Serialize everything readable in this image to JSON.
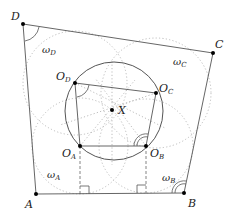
{
  "diagram": {
    "title": "",
    "colors": {
      "line": "#555555",
      "dotted": "#b5b5b5",
      "point": "#000000",
      "label": "#222222",
      "background": "#ffffff"
    },
    "vertices": [
      {
        "id": "A",
        "label": "A",
        "x": 36,
        "y": 194
      },
      {
        "id": "B",
        "label": "B",
        "x": 184,
        "y": 193
      },
      {
        "id": "C",
        "label": "C",
        "x": 213,
        "y": 53
      },
      {
        "id": "D",
        "label": "D",
        "x": 23,
        "y": 24
      }
    ],
    "centers": [
      {
        "id": "O_A",
        "label": "O",
        "sub": "A",
        "x": 80,
        "y": 146
      },
      {
        "id": "O_B",
        "label": "O",
        "sub": "B",
        "x": 146,
        "y": 146
      },
      {
        "id": "O_C",
        "label": "O",
        "sub": "C",
        "x": 156,
        "y": 93
      },
      {
        "id": "O_D",
        "label": "O",
        "sub": "D",
        "x": 75,
        "y": 83
      }
    ],
    "point_X": {
      "label": "X",
      "x": 112,
      "y": 110
    },
    "circumcircle": {
      "cx": 114,
      "cy": 111,
      "r": 49
    },
    "small_circles": [
      {
        "id": "omega_A",
        "label": "ω",
        "sub": "A",
        "cx": 80,
        "cy": 146,
        "r": 48
      },
      {
        "id": "omega_B",
        "label": "ω",
        "sub": "B",
        "cx": 146,
        "cy": 146,
        "r": 47
      },
      {
        "id": "omega_C",
        "label": "ω",
        "sub": "C",
        "cx": 156,
        "cy": 93,
        "r": 55
      },
      {
        "id": "omega_D",
        "label": "ω",
        "sub": "D",
        "cx": 75,
        "cy": 83,
        "r": 52
      }
    ]
  }
}
